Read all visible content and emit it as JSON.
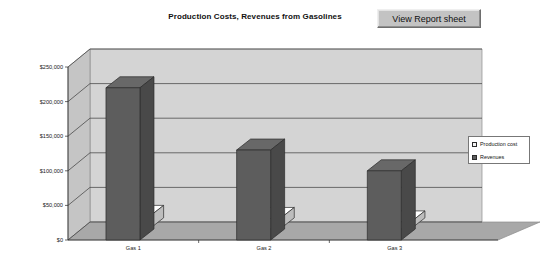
{
  "toolbar": {
    "view_report_label": "View Report sheet"
  },
  "chart_data": {
    "type": "bar",
    "title": "Production Costs, Revenues from Gasolines",
    "xlabel": "",
    "ylabel": "",
    "categories": [
      "Gas 1",
      "Gas 2",
      "Gas 3"
    ],
    "series": [
      {
        "name": "Production cost",
        "color": "#f2f2f2",
        "values": [
          18000,
          15000,
          10000
        ]
      },
      {
        "name": "Revenues",
        "color": "#5d5d5d",
        "values": [
          220000,
          130000,
          100000
        ]
      }
    ],
    "ylim": [
      0,
      250000
    ],
    "ytick_values": [
      0,
      50000,
      100000,
      150000,
      200000,
      250000
    ],
    "ytick_labels": [
      "$0",
      "$50,000",
      "$100,000",
      "$150,000",
      "$200,000",
      "$250,000"
    ],
    "grid": true,
    "legend_position": "right",
    "three_d": true,
    "plot_background": "#d4d4d4",
    "floor_color": "#a8a8a8"
  }
}
